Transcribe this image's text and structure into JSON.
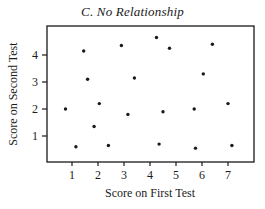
{
  "chart_data": {
    "type": "scatter",
    "title": "C. No Relationship",
    "xlabel": "Score on First Test",
    "ylabel": "Score on Second Test",
    "xlim": [
      0,
      8
    ],
    "ylim": [
      0,
      5
    ],
    "xticks": [
      1,
      2,
      3,
      4,
      5,
      6,
      7
    ],
    "yticks": [
      1,
      2,
      3,
      4
    ],
    "grid": false,
    "legend": null,
    "series": [
      {
        "name": "scores",
        "points": [
          {
            "x": 0.75,
            "y": 2.0
          },
          {
            "x": 1.15,
            "y": 0.6
          },
          {
            "x": 1.45,
            "y": 4.15
          },
          {
            "x": 1.6,
            "y": 3.1
          },
          {
            "x": 1.85,
            "y": 1.35
          },
          {
            "x": 2.05,
            "y": 2.2
          },
          {
            "x": 2.4,
            "y": 0.65
          },
          {
            "x": 2.9,
            "y": 4.35
          },
          {
            "x": 3.15,
            "y": 1.8
          },
          {
            "x": 3.4,
            "y": 3.15
          },
          {
            "x": 4.25,
            "y": 4.65
          },
          {
            "x": 4.35,
            "y": 0.7
          },
          {
            "x": 4.5,
            "y": 1.9
          },
          {
            "x": 4.75,
            "y": 4.25
          },
          {
            "x": 5.7,
            "y": 2.0
          },
          {
            "x": 5.75,
            "y": 0.55
          },
          {
            "x": 6.05,
            "y": 3.3
          },
          {
            "x": 6.4,
            "y": 4.4
          },
          {
            "x": 7.0,
            "y": 2.2
          },
          {
            "x": 7.15,
            "y": 0.65
          }
        ]
      }
    ]
  },
  "colors": {
    "ink": "#1a1a1a",
    "background": "#ffffff"
  }
}
